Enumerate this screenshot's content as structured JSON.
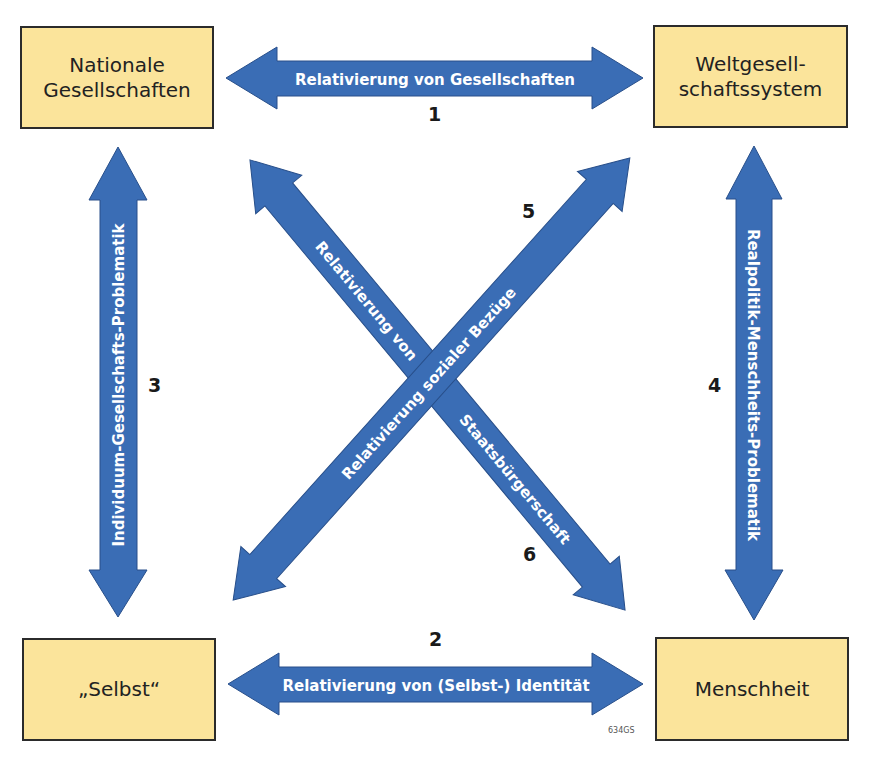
{
  "nodes": {
    "nationale_gesellschaften": {
      "line1": "Nationale",
      "line2": "Gesellschaften"
    },
    "weltgesellschaftssystem": {
      "line1": "Weltgesell-",
      "line2": "schaftssystem"
    },
    "selbst": {
      "label": "„Selbst“"
    },
    "menschheit": {
      "label": "Menschheit"
    }
  },
  "relations": [
    {
      "number": "1",
      "label": "Relativierung von Gesellschaften",
      "from": "Nationale Gesellschaften",
      "to": "Weltgesellschaftssystem"
    },
    {
      "number": "2",
      "label": "Relativierung von (Selbst-) Identität",
      "from": "„Selbst“",
      "to": "Menschheit"
    },
    {
      "number": "3",
      "label": "Individuum-Gesellschafts-Problematik",
      "from": "Nationale Gesellschaften",
      "to": "„Selbst“"
    },
    {
      "number": "4",
      "label": "Realpolitik-Menschheits-Problematik",
      "from": "Weltgesellschaftssystem",
      "to": "Menschheit"
    },
    {
      "number": "5",
      "label": "Relativierung sozialer Bezüge",
      "from": "„Selbst“",
      "to": "Weltgesellschaftssystem"
    },
    {
      "number": "6",
      "label_line1": "Relativierung von",
      "label_line2": "Staatsbürgerschaft",
      "from": "Nationale Gesellschaften",
      "to": "Menschheit"
    }
  ],
  "figure_code": "634GS",
  "colors": {
    "arrow_fill": "#3a6db5",
    "arrow_stroke": "#284f8a",
    "box_fill": "#fbe49b",
    "box_border": "#2b2b2b",
    "arrow_text": "#ffffff"
  }
}
